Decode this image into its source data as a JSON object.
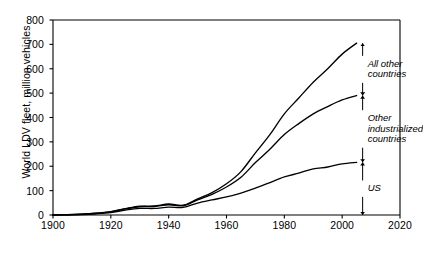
{
  "chart_data": {
    "type": "line",
    "title": "",
    "xlabel": "",
    "ylabel": "World LDV fleet, million vehicles",
    "xlim": [
      1900,
      2020
    ],
    "ylim": [
      0,
      800
    ],
    "xticks": [
      1900,
      1920,
      1940,
      1960,
      1980,
      2000,
      2020
    ],
    "yticks": [
      0,
      100,
      200,
      300,
      400,
      500,
      600,
      700,
      800
    ],
    "grid": false,
    "legend": "none",
    "stacked": true,
    "note": "Cumulative stacked curves; bands between curves are labelled by double-headed arrows at 2005",
    "x": [
      1900,
      1905,
      1910,
      1915,
      1920,
      1925,
      1930,
      1935,
      1940,
      1945,
      1950,
      1955,
      1960,
      1965,
      1970,
      1975,
      1980,
      1985,
      1990,
      1995,
      2000,
      2005
    ],
    "series": [
      {
        "name": "US",
        "label": "US",
        "values": [
          0,
          1,
          2,
          5,
          10,
          20,
          27,
          27,
          32,
          31,
          49,
          62,
          74,
          90,
          110,
          133,
          156,
          172,
          189,
          197,
          210,
          216
        ]
      },
      {
        "name": "Other industrialized countries",
        "label": "Other industrialized countries",
        "cumulative_values": [
          0,
          1,
          3,
          7,
          13,
          25,
          34,
          35,
          42,
          38,
          62,
          85,
          115,
          155,
          215,
          270,
          330,
          375,
          415,
          445,
          472,
          490
        ]
      },
      {
        "name": "All other countries",
        "label": "All other countries",
        "cumulative_values": [
          0,
          1,
          3,
          7,
          14,
          26,
          36,
          37,
          45,
          40,
          66,
          92,
          128,
          178,
          255,
          330,
          415,
          480,
          545,
          600,
          660,
          705
        ]
      }
    ],
    "annotations": [
      {
        "id": "all-other-countries",
        "text_lines": [
          "All other",
          "countries"
        ],
        "band_top": 705,
        "band_bottom": 490,
        "at_year": 2005
      },
      {
        "id": "other-industrialized-countries",
        "text_lines": [
          "Other",
          "industrialized",
          "countries"
        ],
        "band_top": 490,
        "band_bottom": 216,
        "at_year": 2005
      },
      {
        "id": "us",
        "text_lines": [
          "US"
        ],
        "band_top": 216,
        "band_bottom": 0,
        "at_year": 2005
      }
    ]
  },
  "colors": {
    "line": "#000000",
    "axis": "#000000",
    "background": "#ffffff"
  }
}
